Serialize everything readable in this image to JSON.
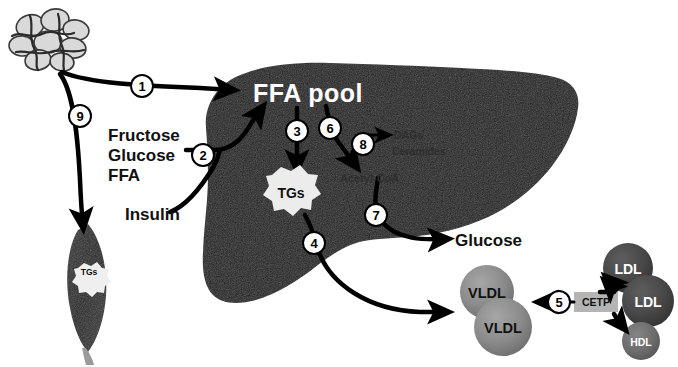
{
  "figure": {
    "background_color": "#ffffff"
  },
  "organs": {
    "adipose": {
      "name": "Adipose tissue (adipocyte cluster)",
      "cell_fill": "#d8d8d8",
      "cell_stroke": "#3a3a3a"
    },
    "liver": {
      "name": "Liver",
      "fill": "#1a1a1a"
    },
    "muscle": {
      "name": "Skeletal muscle cell",
      "fill": "#2b2b2b",
      "label": "TGs"
    }
  },
  "liver_labels": {
    "ffa_pool": "FFA pool",
    "tgs": "TGs",
    "acetyl_coa": "Acetyl-CoA",
    "dags": "DAGs",
    "ceramides": "Ceramides"
  },
  "input_labels": {
    "line1": "Fructose",
    "line2": "Glucose",
    "line3": "FFA",
    "insulin": "Insulin"
  },
  "output_labels": {
    "glucose": "Glucose"
  },
  "lipoproteins": [
    {
      "label": "VLDL",
      "color": "#8a8a8a",
      "text_color": "#000000"
    },
    {
      "label": "VLDL",
      "color": "#8a8a8a",
      "text_color": "#000000"
    },
    {
      "label": "LDL",
      "color": "#4a4a4a",
      "text_color": "#ffffff"
    },
    {
      "label": "LDL",
      "color": "#4a4a4a",
      "text_color": "#ffffff"
    },
    {
      "label": "HDL",
      "color": "#6e6e6e",
      "text_color": "#ffffff"
    }
  ],
  "enzyme_box": {
    "label": "CETP",
    "fill": "#b4b4b4",
    "text_color": "#1a1a1a"
  },
  "step_numbers": {
    "n1": "1",
    "n2": "2",
    "n3": "3",
    "n4": "4",
    "n5": "5",
    "n6": "6",
    "n7": "7",
    "n8": "8",
    "n9": "9"
  },
  "colors": {
    "arrow": "#000000",
    "liver": "#1a1a1a",
    "vldl": "#8a8a8a",
    "ldl": "#4a4a4a",
    "hdl": "#6e6e6e",
    "cetp_box": "#b4b4b4",
    "adipocyte": "#d8d8d8"
  }
}
